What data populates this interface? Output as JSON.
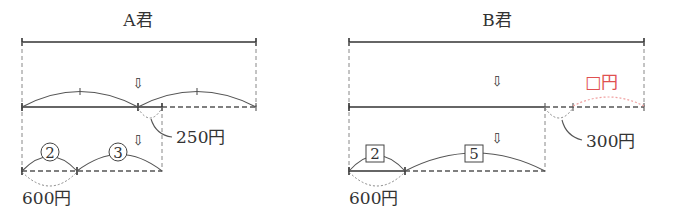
{
  "diagram_a": {
    "title": "A君",
    "circle_label_1": "2",
    "circle_label_2": "3",
    "remainder_label": "250円",
    "base_label": "600円",
    "arrow_glyph": "⇩"
  },
  "diagram_b": {
    "title": "B君",
    "box_label_1": "2",
    "box_label_2": "5",
    "remainder_label": "300円",
    "unknown_label": "□円",
    "base_label": "600円",
    "arrow_glyph": "⇩"
  },
  "colors": {
    "line": "#333333",
    "unknown_highlight": "#e05050"
  }
}
